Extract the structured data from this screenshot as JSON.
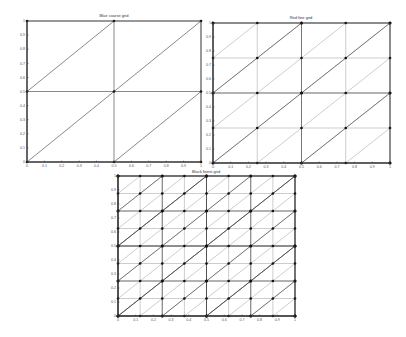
{
  "figure": {
    "width": 406,
    "height": 337,
    "background": "#ffffff"
  },
  "chart_data": [
    {
      "type": "line",
      "title": "Blue coarse grid",
      "description": "Structured triangular mesh on the unit square, 2x2 cells, each split by a diagonal from lower-left to upper-right",
      "grid_divisions": 2,
      "overlay_divisions": [],
      "xlim": [
        0,
        1
      ],
      "ylim": [
        0,
        1
      ],
      "xticks": [
        "0",
        "0.1",
        "0.2",
        "0.3",
        "0.4",
        "0.5",
        "0.6",
        "0.7",
        "0.8",
        "0.9",
        "1"
      ],
      "yticks": [
        "0",
        "0.1",
        "0.2",
        "0.3",
        "0.4",
        "0.5",
        "0.6",
        "0.7",
        "0.8",
        "0.9",
        "1"
      ],
      "nodes_marked": true,
      "box": {
        "left": 27,
        "right": 201,
        "top": 21,
        "bottom": 162
      }
    },
    {
      "type": "line",
      "title": "Red fine grid",
      "description": "Structured triangular mesh on the unit square, 4x4 cells with diagonals; coarse 2x2 mesh overlaid darker",
      "grid_divisions": 4,
      "overlay_divisions": [
        2
      ],
      "xlim": [
        0,
        1
      ],
      "ylim": [
        0,
        1
      ],
      "xticks": [
        "0",
        "0.1",
        "0.2",
        "0.3",
        "0.4",
        "0.5",
        "0.6",
        "0.7",
        "0.8",
        "0.9",
        "1"
      ],
      "yticks": [
        "0",
        "0.1",
        "0.2",
        "0.3",
        "0.4",
        "0.5",
        "0.6",
        "0.7",
        "0.8",
        "0.9",
        "1"
      ],
      "nodes_marked": true,
      "box": {
        "left": 213,
        "right": 390,
        "top": 23,
        "bottom": 163
      }
    },
    {
      "type": "line",
      "title": "Black finest grid",
      "description": "Structured triangular mesh on the unit square, 8x8 cells with diagonals; 4x4 and 2x2 meshes overlaid darker",
      "grid_divisions": 8,
      "overlay_divisions": [
        4,
        2
      ],
      "xlim": [
        0,
        1
      ],
      "ylim": [
        0,
        1
      ],
      "xticks": [
        "0",
        "0.1",
        "0.2",
        "0.3",
        "0.4",
        "0.5",
        "0.6",
        "0.7",
        "0.8",
        "0.9",
        "1"
      ],
      "yticks": [
        "0",
        "0.1",
        "0.2",
        "0.3",
        "0.4",
        "0.5",
        "0.6",
        "0.7",
        "0.8",
        "0.9",
        "1"
      ],
      "nodes_marked": true,
      "box": {
        "left": 118,
        "right": 295,
        "top": 176,
        "bottom": 316
      }
    }
  ],
  "colors": {
    "axis": "#333333",
    "fine_line": "#9a9a9a",
    "coarse_line": "#3a3a3a",
    "node": "#111111",
    "tick_text": "#555555"
  }
}
